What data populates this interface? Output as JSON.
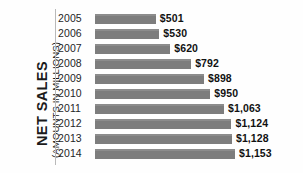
{
  "chart_data": {
    "type": "bar",
    "orientation": "horizontal",
    "title": "",
    "ylabel": "NET SALES",
    "ylabel_sub": "(AMOUNTS IN MILLIONS)",
    "xlabel": "",
    "grid": false,
    "legend": "none",
    "xlim": [
      0,
      1153
    ],
    "bar_color": "#7d7d7d",
    "label_color": "#111111",
    "categories": [
      "2005",
      "2006",
      "2007",
      "2008",
      "2009",
      "2010",
      "2011",
      "2012",
      "2013",
      "2014"
    ],
    "values": [
      501,
      530,
      620,
      792,
      898,
      950,
      1063,
      1124,
      1128,
      1153
    ],
    "value_labels": [
      "$501",
      "$530",
      "$620",
      "$792",
      "$898",
      "$950",
      "$1,063",
      "$1,124",
      "$1,128",
      "$1,153"
    ]
  }
}
